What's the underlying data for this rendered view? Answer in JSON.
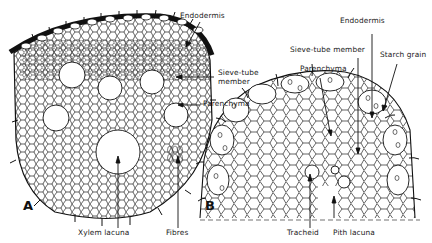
{
  "figure": {
    "panels": [
      {
        "id": "A",
        "letter": "A",
        "labels": {
          "endodermis": "Endodermis",
          "sieve_tube_member": "Sieve-tube member",
          "sieve_tube_line1": "Sieve-tube",
          "sieve_tube_line2": "member",
          "parenchyma": "Parenchyma",
          "xylem_lacuna": "Xylem lacuna",
          "fibres": "Fibres"
        }
      },
      {
        "id": "B",
        "letter": "B",
        "labels": {
          "endodermis": "Endodermis",
          "sieve_tube_member": "Sieve-tube member",
          "starch_grain": "Starch grain",
          "parenchyma": "Parenchyma",
          "tracheid": "Tracheid",
          "pith_lacuna": "Pith lacuna"
        }
      }
    ],
    "colors": {
      "ink": "#111111",
      "background": "#ffffff"
    }
  }
}
